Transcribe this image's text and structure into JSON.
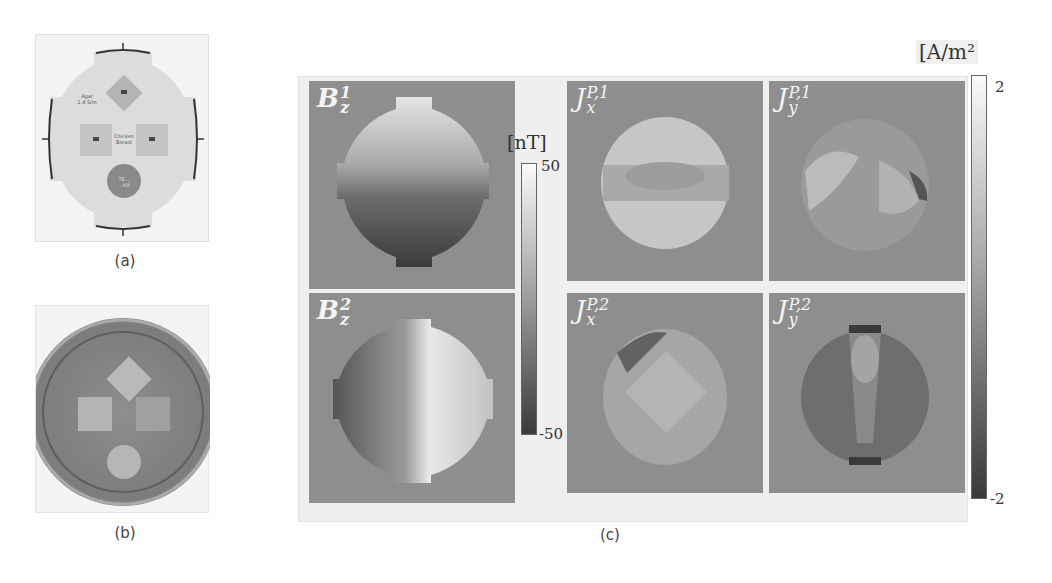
{
  "figure": {
    "panels": {
      "a": {
        "caption": "(a)",
        "description": "phantom schematic",
        "labels": {
          "agar": [
            "Agar",
            "1.4 S/m"
          ],
          "center": [
            "Chicken",
            "Breast"
          ],
          "bottom": [
            "TE...",
            "...HA"
          ],
          "electrodes": [
            "E1",
            "E2",
            "E3",
            "E4"
          ],
          "inclusion_marks": [
            "■",
            "■",
            "■"
          ]
        }
      },
      "b": {
        "caption": "(b)",
        "description": "MR magnitude image of phantom"
      },
      "c": {
        "caption": "(c)",
        "maps": [
          {
            "id": "Bz1",
            "base": "B",
            "sup": "1",
            "sub": "z"
          },
          {
            "id": "Bz2",
            "base": "B",
            "sup": "2",
            "sub": "z"
          },
          {
            "id": "Jx1",
            "base": "J",
            "sup": "P,1",
            "sub": "x"
          },
          {
            "id": "Jy1",
            "base": "J",
            "sup": "P,1",
            "sub": "y"
          },
          {
            "id": "Jx2",
            "base": "J",
            "sup": "P,2",
            "sub": "x"
          },
          {
            "id": "Jy2",
            "base": "J",
            "sup": "P,2",
            "sub": "y"
          }
        ],
        "colorbar_B": {
          "unit": "[nT]",
          "max": "50",
          "min": "-50"
        },
        "colorbar_J": {
          "unit": "[A/m²",
          "max": "2",
          "min": "-2"
        }
      }
    },
    "colors": {
      "map_background": "#8e8e8e",
      "panel_frame": "#efefef",
      "label_text": "#f4f4f4"
    }
  }
}
